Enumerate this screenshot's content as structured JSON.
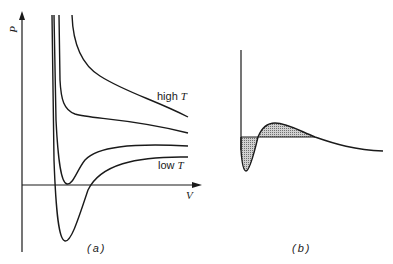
{
  "figure": {
    "panel_a": {
      "caption": "(a)",
      "y_axis_label": "P",
      "x_axis_label": "V",
      "label_high": "high",
      "label_low": "low",
      "label_var": "T",
      "curves": [
        "isotherm-lowest",
        "isotherm-low",
        "isotherm-critical",
        "isotherm-high"
      ]
    },
    "panel_b": {
      "caption": "(b)",
      "description": "Isotherm with Maxwell equal-area construction, shaded regions"
    },
    "colors": {
      "line": "#1a1a1a",
      "shade": "#b8b8b8",
      "background": "#ffffff"
    }
  }
}
